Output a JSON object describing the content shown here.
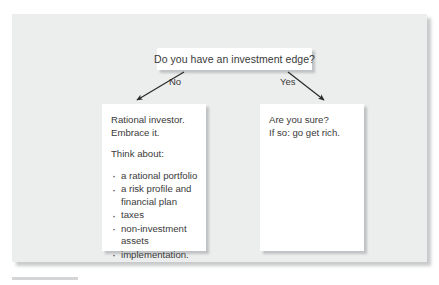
{
  "figure": {
    "decision": {
      "question": "Do you have an investment edge?"
    },
    "branches": {
      "no_label": "No",
      "yes_label": "Yes"
    },
    "outcomes": {
      "left": {
        "lead_line_1": "Rational investor.",
        "lead_line_2": "Embrace it.",
        "prompt": "Think about:",
        "bullets": [
          "a rational portfolio",
          "a risk profile and financial plan",
          "taxes",
          "non-investment assets",
          "implementation."
        ]
      },
      "right": {
        "lead_line_1": "Are you sure?",
        "lead_line_2": "If so: go get rich."
      }
    },
    "colors": {
      "panel_background": "#eceded",
      "box_background": "#ffffff",
      "text": "#3a3a3a",
      "arrow": "#2b2b2b",
      "rule": "#d3d5d6"
    }
  }
}
